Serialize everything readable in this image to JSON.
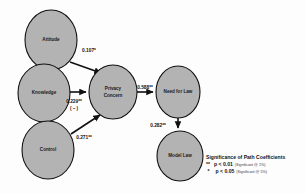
{
  "diagram": {
    "nodes": [
      {
        "id": "attitude",
        "label": "Attitude",
        "cx": 51,
        "cy": 40,
        "rx": 26,
        "ry": 30
      },
      {
        "id": "knowledge",
        "label": "Knowledge",
        "cx": 44,
        "cy": 93,
        "rx": 26,
        "ry": 29
      },
      {
        "id": "control",
        "label": "Control",
        "cx": 48,
        "cy": 150,
        "rx": 26,
        "ry": 29
      },
      {
        "id": "privacy_concern",
        "label_line1": "Privacy",
        "label_line2": "Concern",
        "cx": 113,
        "cy": 92,
        "rx": 24,
        "ry": 27
      },
      {
        "id": "need_for_law",
        "label": "Need for Law",
        "cx": 178,
        "cy": 92,
        "rx": 22,
        "ry": 26
      },
      {
        "id": "model_law",
        "label": "Model Law",
        "cx": 180,
        "cy": 156,
        "rx": 23,
        "ry": 25
      }
    ],
    "paths": [
      {
        "id": "attitude-to-privacy",
        "from": "attitude",
        "to": "privacy_concern",
        "coefficient": "0.107*",
        "label_x": 89,
        "label_y": 52
      },
      {
        "id": "knowledge-to-privacy",
        "from": "knowledge",
        "to": "privacy_concern",
        "coefficient": "0.229**",
        "annotation": "( – )",
        "label_x": 74,
        "label_y": 103,
        "annotation_x": 74,
        "annotation_y": 110
      },
      {
        "id": "control-to-privacy",
        "from": "control",
        "to": "privacy_concern",
        "coefficient": "0.271**",
        "label_x": 84,
        "label_y": 139
      },
      {
        "id": "privacy-to-needforlaw",
        "from": "privacy_concern",
        "to": "need_for_law",
        "coefficient": "0.588**",
        "label_x": 145,
        "label_y": 89
      },
      {
        "id": "needforlaw-to-modellaw",
        "from": "need_for_law",
        "to": "model_law",
        "coefficient": "0.282**",
        "label_x": 158,
        "label_y": 127
      }
    ]
  },
  "legend": {
    "title": "Significance of Path Coefficients",
    "entries": [
      {
        "stars": "**",
        "p_value": "p < 0.01",
        "note": "(Significant @ 1%)"
      },
      {
        "stars": "*",
        "p_value": "p < 0.05",
        "note": "(Significant @ 5%)"
      }
    ]
  },
  "colors": {
    "node_fill": "#b3b3b3",
    "node_stroke": "#111111",
    "arrow": "#111111",
    "background": "#fdfdfd"
  }
}
